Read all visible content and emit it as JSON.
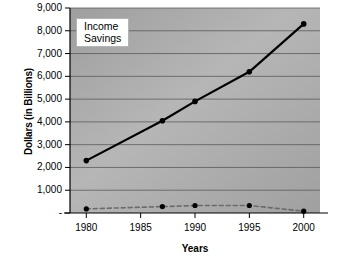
{
  "chart_data": {
    "type": "line",
    "title": "",
    "xlabel": "Years",
    "ylabel": "Dollars (in Billions)",
    "x": [
      1980,
      1987,
      1990,
      1995,
      2000
    ],
    "xtick_labels": [
      "1980",
      "1985",
      "1990",
      "1995",
      "2000"
    ],
    "xticks": [
      1980,
      1985,
      1990,
      1995,
      2000
    ],
    "xlim": [
      1978.5,
      2001.5
    ],
    "ylim": [
      0,
      9000
    ],
    "yticks": [
      0,
      1000,
      2000,
      3000,
      4000,
      5000,
      6000,
      7000,
      8000,
      9000
    ],
    "ytick_labels": [
      "-",
      "1,000",
      "2,000",
      "3,000",
      "4,000",
      "5,000",
      "6,000",
      "7,000",
      "8,000",
      "9,000"
    ],
    "grid": "horizontal",
    "legend_position": "top-left",
    "plot_background": "#a8a8a8",
    "series": [
      {
        "name": "Income",
        "values": [
          2300,
          4050,
          4900,
          6200,
          8300
        ],
        "color": "#000000",
        "style": "solid",
        "marker": "circle"
      },
      {
        "name": "Savings",
        "values": [
          180,
          280,
          330,
          330,
          80
        ],
        "color": "#6b6b6b",
        "style": "dashed",
        "marker": "circle"
      }
    ]
  },
  "legend": {
    "entries": [
      {
        "label": "Income"
      },
      {
        "label": "Savings"
      }
    ]
  },
  "axes": {
    "y_title": "Dollars (in Billions)",
    "x_title": "Years"
  }
}
